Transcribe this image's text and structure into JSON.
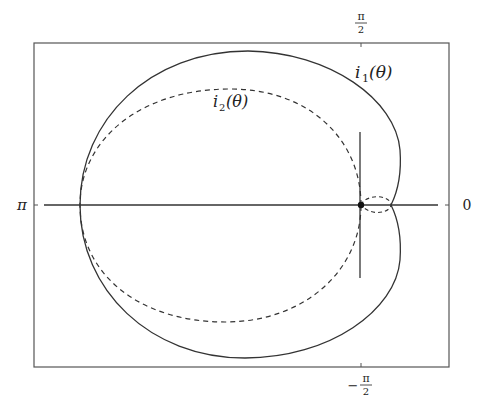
{
  "figure": {
    "curves": [
      {
        "id": "i1",
        "label_base": "i",
        "label_sub": "1",
        "label_arg": "(θ)",
        "style": "solid"
      },
      {
        "id": "i2",
        "label_base": "i",
        "label_sub": "2",
        "label_arg": "(θ)",
        "style": "dashed"
      }
    ],
    "axis_labels": {
      "top": {
        "num": "π",
        "den": "2"
      },
      "bottom": {
        "sign": "−",
        "num": "π",
        "den": "2"
      },
      "left": "π",
      "right": "0"
    },
    "colors": {
      "line": "#333333",
      "frame": "#555555",
      "background": "#ffffff"
    }
  }
}
